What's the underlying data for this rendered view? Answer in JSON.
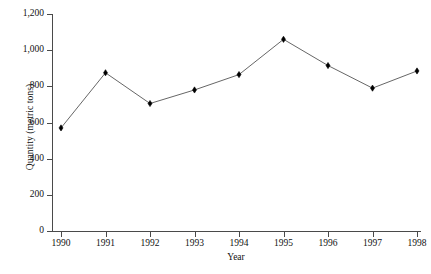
{
  "chart_data": {
    "type": "line",
    "title": "",
    "xlabel": "Year",
    "ylabel": "Quantity (metric tons)",
    "categories": [
      "1990",
      "1991",
      "1992",
      "1993",
      "1994",
      "1995",
      "1996",
      "1997",
      "1998"
    ],
    "x": [
      1990,
      1991,
      1992,
      1993,
      1994,
      1995,
      1996,
      1997,
      1998
    ],
    "values": [
      570,
      875,
      705,
      780,
      865,
      1060,
      915,
      790,
      885
    ],
    "series": [
      {
        "name": "Quantity",
        "values": [
          570,
          875,
          705,
          780,
          865,
          1060,
          915,
          790,
          885
        ]
      }
    ],
    "ylim": [
      0,
      1200
    ],
    "xlim": [
      1989.5,
      1998.5
    ],
    "ytick_labels": [
      "0",
      "200",
      "400",
      "600",
      "800",
      "1,000",
      "1,200"
    ],
    "ytick_values": [
      0,
      200,
      400,
      600,
      800,
      1000,
      1200
    ],
    "xtick_labels": [
      "1990",
      "1991",
      "1992",
      "1993",
      "1994",
      "1995",
      "1996",
      "1997",
      "1998"
    ],
    "grid": false,
    "legend": false,
    "legend_position": "none",
    "marker": "diamond",
    "line_color": "#555555",
    "marker_color": "#000000",
    "axis_color": "#4a4a4a",
    "background_color": "#ffffff"
  }
}
